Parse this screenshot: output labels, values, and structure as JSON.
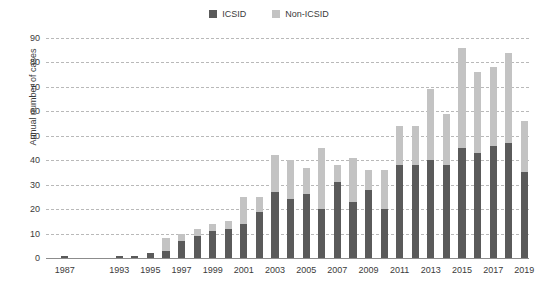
{
  "legend": {
    "items": [
      {
        "label": "ICSID",
        "color": "#5a5a5a",
        "icon": "square-swatch"
      },
      {
        "label": "Non-ICSID",
        "color": "#c3c3c3",
        "icon": "square-swatch"
      }
    ]
  },
  "chart_data": {
    "type": "bar",
    "stacked": true,
    "title": "",
    "xlabel": "",
    "ylabel": "Annual number of cases",
    "ylim": [
      0,
      90
    ],
    "ytick_step": 10,
    "yticks": [
      "0",
      "10",
      "20",
      "30",
      "40",
      "50",
      "60",
      "70",
      "80",
      "90"
    ],
    "grid": true,
    "grid_style": "dashed-horizontal",
    "legend_position": "top-center",
    "categories": [
      "1987",
      "1993",
      "1994",
      "1995",
      "1996",
      "1997",
      "1998",
      "1999",
      "2000",
      "2001",
      "2002",
      "2003",
      "2004",
      "2005",
      "2006",
      "2007",
      "2008",
      "2009",
      "2010",
      "2011",
      "2012",
      "2013",
      "2014",
      "2015",
      "2016",
      "2017",
      "2018",
      "2019"
    ],
    "xtick_labels": [
      "1987",
      "1993",
      "1995",
      "1997",
      "1999",
      "2001",
      "2003",
      "2005",
      "2007",
      "2009",
      "2011",
      "2013",
      "2015",
      "2017",
      "2019"
    ],
    "series": [
      {
        "name": "ICSID",
        "color": "#5a5a5a",
        "values": [
          1,
          1,
          1,
          2,
          3,
          7,
          9,
          11,
          12,
          14,
          19,
          27,
          24,
          26,
          20,
          31,
          23,
          28,
          20,
          38,
          38,
          40,
          38,
          45,
          43,
          46,
          47,
          35
        ]
      },
      {
        "name": "Non-ICSID",
        "color": "#c3c3c3",
        "values": [
          0,
          0,
          0,
          0,
          5,
          3,
          3,
          3,
          3,
          11,
          6,
          15,
          16,
          11,
          25,
          7,
          18,
          8,
          16,
          16,
          16,
          29,
          21,
          41,
          33,
          32,
          37,
          21
        ]
      }
    ],
    "totals": [
      1,
      1,
      1,
      2,
      8,
      10,
      12,
      14,
      15,
      25,
      25,
      42,
      40,
      37,
      45,
      38,
      41,
      36,
      36,
      54,
      54,
      69,
      59,
      86,
      76,
      78,
      84,
      56
    ],
    "gap_after_index": 0
  }
}
